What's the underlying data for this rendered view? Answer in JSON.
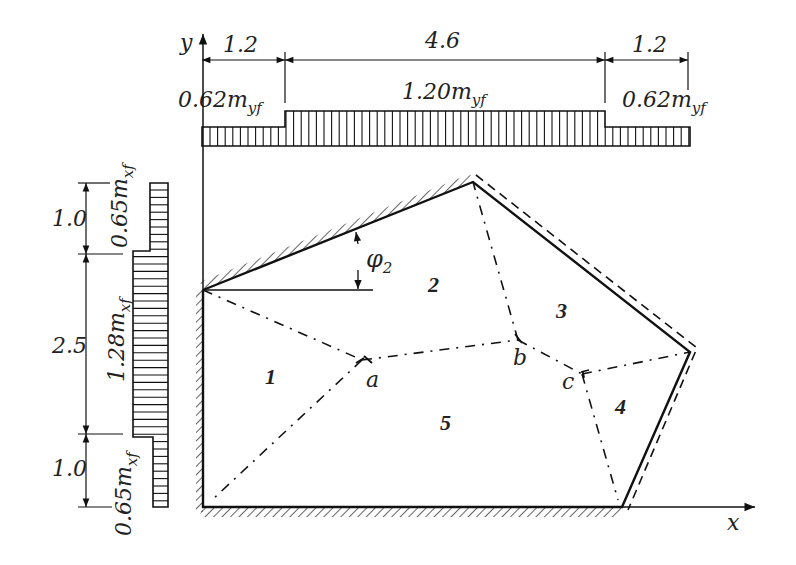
{
  "diagram": {
    "type": "yield-line slab diagram",
    "axes": {
      "x_label": "x",
      "y_label": "y"
    },
    "top_moment_diagram": {
      "dimensions": [
        "1.2",
        "4.6",
        "1.2"
      ],
      "labels": {
        "left": {
          "coef": "0.62m",
          "sub": "yf"
        },
        "middle": {
          "coef": "1.20m",
          "sub": "yf"
        },
        "right": {
          "coef": "0.62m",
          "sub": "yf"
        }
      }
    },
    "left_moment_diagram": {
      "dimensions": [
        "1.0",
        "2.5",
        "1.0"
      ],
      "labels": {
        "top": {
          "coef": "0.65m",
          "sub": "xf"
        },
        "middle": {
          "coef": "1.28m",
          "sub": "xf"
        },
        "bottom": {
          "coef": "0.65m",
          "sub": "xf"
        }
      }
    },
    "angle_label": {
      "symbol": "φ",
      "sub": "2"
    },
    "regions": [
      "1",
      "2",
      "3",
      "4",
      "5"
    ],
    "nodes": [
      "a",
      "b",
      "c"
    ]
  }
}
